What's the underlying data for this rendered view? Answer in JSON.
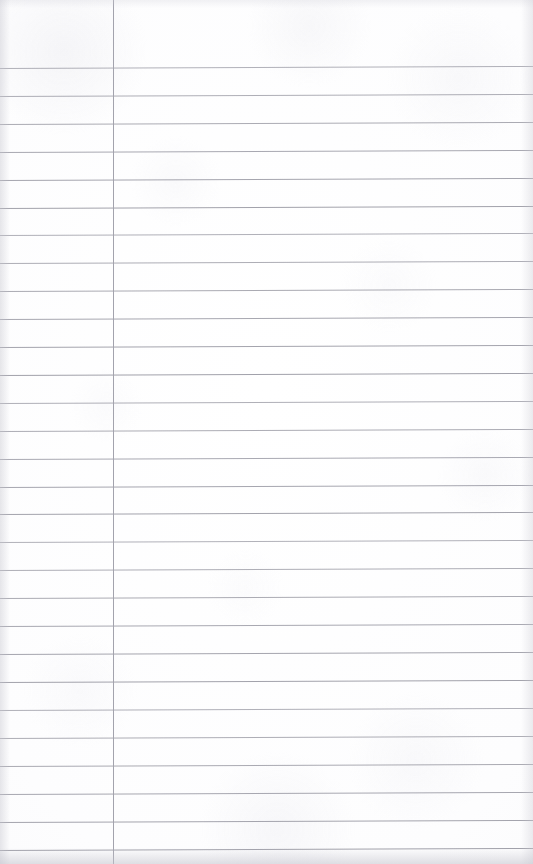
{
  "document": {
    "kind": "scanned-ruled-notepad-page",
    "title": "Blank Ruled Notepad Page",
    "state": "blank",
    "visible_text": "",
    "width_px": 533,
    "height_px": 864
  },
  "paper": {
    "background_color": "#fdfdfd",
    "edge_shadow_color": "#c8c8d0",
    "has_visible_writing": false,
    "has_header": false,
    "has_page_number": false
  },
  "ruling": {
    "line_color": "#9b9ba5",
    "line_thickness_px": 1,
    "first_line_y": 68,
    "line_spacing_px": 27.9,
    "line_count": 29,
    "skew_deg": -0.22,
    "line_y_positions": [
      68,
      96,
      124,
      152,
      180,
      208,
      235,
      263,
      291,
      319,
      347,
      375,
      403,
      431,
      459,
      487,
      514,
      542,
      570,
      598,
      626,
      654,
      682,
      710,
      738,
      766,
      794,
      822,
      850
    ]
  },
  "margin_rule": {
    "orientation": "vertical",
    "x_position": 113,
    "color": "#a3a3ad",
    "thickness_px": 1,
    "spans_full_height": true
  },
  "regions": {
    "left_margin_label": "left-margin-column",
    "right_body_label": "main-writing-column"
  }
}
